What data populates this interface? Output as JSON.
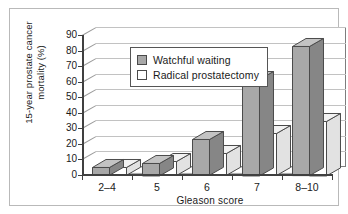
{
  "figure": {
    "border_color": "#b9b9b9",
    "background": "#ffffff"
  },
  "chart_data": {
    "type": "bar",
    "title": "",
    "subtitle": "",
    "xlabel": "Gleason score",
    "ylabel": "15-year prostate cancer mortality (%)",
    "categories": [
      "2–4",
      "5",
      "6",
      "7",
      "8–10"
    ],
    "series": [
      {
        "name": "Watchful waiting",
        "color": "#a8a8a8",
        "values": [
          5,
          8,
          23,
          62,
          83
        ]
      },
      {
        "name": "Radical prostatectomy",
        "color": "#ffffff",
        "values": [
          5,
          9,
          14,
          27,
          35
        ]
      }
    ],
    "ylim": [
      0,
      90
    ],
    "ytick_step": 10,
    "yticks": [
      0,
      10,
      20,
      30,
      40,
      50,
      60,
      70,
      80,
      90
    ],
    "ytick_labels": [
      "0",
      "10",
      "20",
      "30",
      "40",
      "50",
      "60",
      "70",
      "80",
      "90"
    ],
    "grid": true,
    "grid_axis": "y",
    "grid_color": "#c2c2c2",
    "legend_position": "upper left",
    "style": "3d-perspective",
    "bar_edge_color": "#4a4a4a",
    "axis_color": "#404040"
  },
  "legend": {
    "items": [
      {
        "label": "Watchful waiting",
        "swatch_color": "#a8a8a8"
      },
      {
        "label": "Radical prostatectomy",
        "swatch_color": "#ffffff"
      }
    ]
  },
  "axes": {
    "y_title": "15-year prostate cancer mortality (%)",
    "x_title": "Gleason score"
  }
}
